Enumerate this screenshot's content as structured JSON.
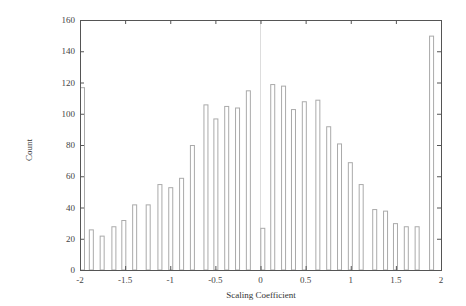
{
  "chart_data": {
    "type": "bar",
    "title": "",
    "xlabel": "Scaling Coefficient",
    "ylabel": "Count",
    "xlim": [
      -2,
      2
    ],
    "ylim": [
      0,
      160
    ],
    "xticks": [
      "-2",
      "-1.5",
      "-1",
      "-0.5",
      "0",
      "0.5",
      "1",
      "1.5",
      "2"
    ],
    "yticks": [
      "0",
      "20",
      "40",
      "60",
      "80",
      "100",
      "120",
      "140",
      "160"
    ],
    "grid": false,
    "legend": null,
    "x": [
      -2.0,
      -1.88,
      -1.76,
      -1.63,
      -1.52,
      -1.4,
      -1.25,
      -1.12,
      -1.0,
      -0.88,
      -0.76,
      -0.61,
      -0.5,
      -0.38,
      -0.26,
      -0.14,
      0.02,
      0.13,
      0.25,
      0.36,
      0.48,
      0.63,
      0.75,
      0.87,
      0.99,
      1.11,
      1.26,
      1.38,
      1.49,
      1.61,
      1.73,
      1.89
    ],
    "values": [
      117,
      26,
      22,
      28,
      32,
      42,
      42,
      55,
      53,
      59,
      80,
      106,
      97,
      105,
      104,
      115,
      27,
      119,
      118,
      103,
      108,
      109,
      92,
      81,
      69,
      55,
      39,
      38,
      30,
      28,
      28,
      150
    ],
    "annotations": [
      "faint vertical reference line at x = 0"
    ]
  },
  "colors": {
    "axis": "#555555",
    "bar_outline": "#aaaaaa",
    "bar_fill": "#ffffff",
    "text": "#444444"
  }
}
